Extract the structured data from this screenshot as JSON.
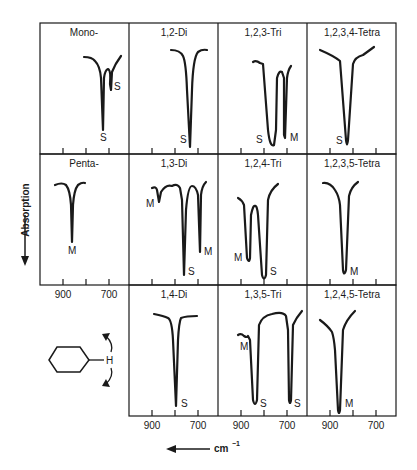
{
  "figure": {
    "y_axis_label": "Absorption",
    "x_axis_label": "cm",
    "x_axis_superscript": "−1",
    "tick_labels": [
      "900",
      "700"
    ],
    "molecule_label": "H",
    "ink_color": "#1a1a1a"
  },
  "panels": [
    {
      "title": "Mono-",
      "row": 0,
      "col": 0,
      "bands": [
        {
          "label": "S",
          "pos": "main"
        },
        {
          "label": "S",
          "pos": "shoulder"
        }
      ]
    },
    {
      "title": "1,2-Di",
      "row": 0,
      "col": 1,
      "bands": [
        {
          "label": "S"
        }
      ]
    },
    {
      "title": "1,2,3-Tri",
      "row": 0,
      "col": 2,
      "bands": [
        {
          "label": "S"
        },
        {
          "label": "M"
        }
      ]
    },
    {
      "title": "1,2,3,4-Tetra",
      "row": 0,
      "col": 3,
      "bands": [
        {
          "label": "S"
        }
      ]
    },
    {
      "title": "Penta-",
      "row": 1,
      "col": 0,
      "bands": [
        {
          "label": "M"
        }
      ]
    },
    {
      "title": "1,3-Di",
      "row": 1,
      "col": 1,
      "bands": [
        {
          "label": "M"
        },
        {
          "label": "S"
        },
        {
          "label": "M"
        }
      ]
    },
    {
      "title": "1,2,4-Tri",
      "row": 1,
      "col": 2,
      "bands": [
        {
          "label": "M"
        },
        {
          "label": "S"
        }
      ]
    },
    {
      "title": "1,2,3,5-Tetra",
      "row": 1,
      "col": 3,
      "bands": [
        {
          "label": "M"
        }
      ]
    },
    {
      "title": "1,4-Di",
      "row": 2,
      "col": 1,
      "bands": [
        {
          "label": "S"
        }
      ]
    },
    {
      "title": "1,3,5-Tri",
      "row": 2,
      "col": 2,
      "bands": [
        {
          "label": "M"
        },
        {
          "label": "S"
        },
        {
          "label": "S"
        }
      ]
    },
    {
      "title": "1,2,4,5-Tetra",
      "row": 2,
      "col": 3,
      "bands": [
        {
          "label": "M"
        }
      ]
    }
  ]
}
